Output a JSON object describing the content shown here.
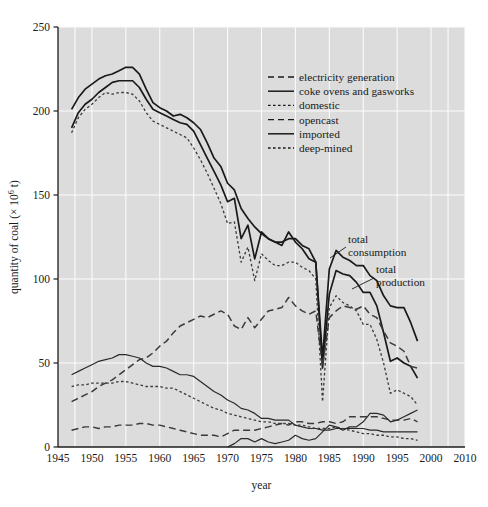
{
  "chart_data": {
    "type": "line",
    "title": "",
    "xlabel": "year",
    "ylabel": "quantity of coal (× 10⁶ t)",
    "xlim": [
      1945,
      2010
    ],
    "ylim": [
      0,
      250
    ],
    "xticks": [
      1945,
      1950,
      1955,
      1960,
      1965,
      1970,
      1975,
      1980,
      1985,
      1990,
      1995,
      2000,
      2010
    ],
    "xtick_labels": [
      "1945",
      "1950",
      "1955",
      "1960",
      "1965",
      "1970",
      "1975",
      "1980",
      "1985",
      "1990",
      "1995",
      "2000",
      "2010"
    ],
    "yticks": [
      0,
      50,
      100,
      150,
      200,
      250
    ],
    "ytick_labels": [
      "0",
      "50",
      "100",
      "150",
      "200",
      "250"
    ],
    "grid": "white gridlines on gray panel, both axes",
    "legend_position": "upper right inside panel",
    "series": [
      {
        "name": "total consumption",
        "style": "solid",
        "color": "#1a1a1a",
        "width": 1.7,
        "annotated": true,
        "x": [
          1947,
          1948,
          1949,
          1950,
          1951,
          1952,
          1953,
          1954,
          1955,
          1956,
          1957,
          1958,
          1959,
          1960,
          1961,
          1962,
          1963,
          1964,
          1965,
          1966,
          1967,
          1968,
          1969,
          1970,
          1971,
          1972,
          1973,
          1974,
          1975,
          1976,
          1977,
          1978,
          1979,
          1980,
          1981,
          1982,
          1983,
          1984,
          1985,
          1986,
          1987,
          1988,
          1989,
          1990,
          1991,
          1992,
          1993,
          1994,
          1995,
          1996,
          1997,
          1998
        ],
        "values": [
          201,
          208,
          213,
          216,
          219,
          221,
          222,
          224,
          226,
          226,
          222,
          213,
          205,
          202,
          200,
          197,
          198,
          196,
          193,
          189,
          181,
          172,
          167,
          157,
          153,
          142,
          136,
          131,
          127,
          124,
          122,
          120,
          128,
          122,
          118,
          112,
          110,
          53,
          106,
          117,
          113,
          111,
          108,
          108,
          102,
          99,
          90,
          84,
          83,
          83,
          74,
          63
        ]
      },
      {
        "name": "total production",
        "style": "solid",
        "color": "#1a1a1a",
        "width": 1.7,
        "annotated": true,
        "x": [
          1947,
          1948,
          1949,
          1950,
          1951,
          1952,
          1953,
          1954,
          1955,
          1956,
          1957,
          1958,
          1959,
          1960,
          1961,
          1962,
          1963,
          1964,
          1965,
          1966,
          1967,
          1968,
          1969,
          1970,
          1971,
          1972,
          1973,
          1974,
          1975,
          1976,
          1977,
          1978,
          1979,
          1980,
          1981,
          1982,
          1983,
          1984,
          1985,
          1986,
          1987,
          1988,
          1989,
          1990,
          1991,
          1992,
          1993,
          1994,
          1995,
          1996,
          1997,
          1998
        ],
        "values": [
          190,
          199,
          204,
          207,
          211,
          214,
          217,
          218,
          218,
          218,
          214,
          207,
          201,
          199,
          197,
          195,
          193,
          192,
          188,
          180,
          172,
          164,
          156,
          146,
          148,
          124,
          132,
          112,
          128,
          124,
          122,
          122,
          124,
          124,
          120,
          118,
          110,
          47,
          91,
          105,
          103,
          102,
          98,
          92,
          92,
          84,
          68,
          51,
          53,
          50,
          48,
          41
        ]
      },
      {
        "name": "deep-mined",
        "style": "dotted",
        "color": "#3a3a3a",
        "width": 1.3,
        "annotated": false,
        "x": [
          1947,
          1948,
          1949,
          1950,
          1951,
          1952,
          1953,
          1954,
          1955,
          1956,
          1957,
          1958,
          1959,
          1960,
          1961,
          1962,
          1963,
          1964,
          1965,
          1966,
          1967,
          1968,
          1969,
          1970,
          1971,
          1972,
          1973,
          1974,
          1975,
          1976,
          1977,
          1978,
          1979,
          1980,
          1981,
          1982,
          1983,
          1984,
          1985,
          1986,
          1987,
          1988,
          1989,
          1990,
          1991,
          1992,
          1993,
          1994,
          1995,
          1996,
          1997,
          1998
        ],
        "values": [
          187,
          196,
          201,
          204,
          208,
          211,
          210,
          211,
          211,
          210,
          206,
          199,
          194,
          192,
          190,
          188,
          186,
          184,
          178,
          171,
          163,
          154,
          145,
          133,
          134,
          110,
          119,
          99,
          115,
          111,
          108,
          108,
          110,
          110,
          107,
          105,
          100,
          27,
          83,
          90,
          86,
          84,
          81,
          73,
          73,
          64,
          50,
          32,
          34,
          32,
          30,
          25
        ]
      },
      {
        "name": "electricity generation",
        "style": "dashed",
        "color": "#3a3a3a",
        "width": 1.5,
        "annotated": false,
        "x": [
          1947,
          1948,
          1949,
          1950,
          1951,
          1952,
          1953,
          1954,
          1955,
          1956,
          1957,
          1958,
          1959,
          1960,
          1961,
          1962,
          1963,
          1964,
          1965,
          1966,
          1967,
          1968,
          1969,
          1970,
          1971,
          1972,
          1973,
          1974,
          1975,
          1976,
          1977,
          1978,
          1979,
          1980,
          1981,
          1982,
          1983,
          1984,
          1985,
          1986,
          1987,
          1988,
          1989,
          1990,
          1991,
          1992,
          1993,
          1994,
          1995,
          1996,
          1997,
          1998
        ],
        "values": [
          27,
          29,
          31,
          33,
          36,
          38,
          40,
          43,
          46,
          49,
          52,
          53,
          56,
          60,
          63,
          68,
          72,
          74,
          76,
          78,
          77,
          79,
          81,
          79,
          72,
          70,
          77,
          71,
          76,
          81,
          82,
          83,
          89,
          84,
          81,
          79,
          81,
          48,
          77,
          81,
          84,
          83,
          82,
          84,
          79,
          77,
          69,
          62,
          60,
          57,
          48,
          47
        ]
      },
      {
        "name": "coke ovens and gasworks",
        "style": "solid",
        "color": "#2a2a2a",
        "width": 1.2,
        "annotated": false,
        "x": [
          1947,
          1948,
          1949,
          1950,
          1951,
          1952,
          1953,
          1954,
          1955,
          1956,
          1957,
          1958,
          1959,
          1960,
          1961,
          1962,
          1963,
          1964,
          1965,
          1966,
          1967,
          1968,
          1969,
          1970,
          1971,
          1972,
          1973,
          1974,
          1975,
          1976,
          1977,
          1978,
          1979,
          1980,
          1981,
          1982,
          1983,
          1984,
          1985,
          1986,
          1987,
          1988,
          1989,
          1990,
          1991,
          1992,
          1993,
          1994,
          1995,
          1996,
          1997,
          1998
        ],
        "values": [
          43,
          45,
          47,
          49,
          51,
          52,
          53,
          55,
          55,
          54,
          53,
          50,
          48,
          48,
          47,
          45,
          43,
          43,
          42,
          39,
          36,
          33,
          31,
          28,
          26,
          23,
          22,
          20,
          17,
          17,
          16,
          16,
          16,
          13,
          12,
          11,
          11,
          10,
          10,
          11,
          11,
          11,
          11,
          11,
          10,
          10,
          9,
          9,
          9,
          9,
          9,
          9
        ]
      },
      {
        "name": "domestic",
        "style": "dotted",
        "color": "#3a3a3a",
        "width": 1.3,
        "annotated": false,
        "x": [
          1947,
          1948,
          1949,
          1950,
          1951,
          1952,
          1953,
          1954,
          1955,
          1956,
          1957,
          1958,
          1959,
          1960,
          1961,
          1962,
          1963,
          1964,
          1965,
          1966,
          1967,
          1968,
          1969,
          1970,
          1971,
          1972,
          1973,
          1974,
          1975,
          1976,
          1977,
          1978,
          1979,
          1980,
          1981,
          1982,
          1983,
          1984,
          1985,
          1986,
          1987,
          1988,
          1989,
          1990,
          1991,
          1992,
          1993,
          1994,
          1995,
          1996,
          1997,
          1998
        ],
        "values": [
          36,
          37,
          37,
          38,
          38,
          38,
          38,
          39,
          39,
          38,
          37,
          36,
          36,
          36,
          35,
          35,
          33,
          31,
          29,
          27,
          25,
          23,
          22,
          20,
          19,
          18,
          17,
          16,
          15,
          15,
          14,
          14,
          14,
          13,
          13,
          12,
          11,
          11,
          11,
          12,
          11,
          10,
          9,
          8,
          8,
          7,
          7,
          6,
          6,
          5,
          5,
          4
        ]
      },
      {
        "name": "opencast",
        "style": "dashed",
        "color": "#3a3a3a",
        "width": 1.4,
        "annotated": false,
        "x": [
          1947,
          1948,
          1949,
          1950,
          1951,
          1952,
          1953,
          1954,
          1955,
          1956,
          1957,
          1958,
          1959,
          1960,
          1961,
          1962,
          1963,
          1964,
          1965,
          1966,
          1967,
          1968,
          1969,
          1970,
          1971,
          1972,
          1973,
          1974,
          1975,
          1976,
          1977,
          1978,
          1979,
          1980,
          1981,
          1982,
          1983,
          1984,
          1985,
          1986,
          1987,
          1988,
          1989,
          1990,
          1991,
          1992,
          1993,
          1994,
          1995,
          1996,
          1997,
          1998
        ],
        "values": [
          10,
          11,
          12,
          12,
          11,
          12,
          12,
          13,
          13,
          13,
          14,
          14,
          13,
          13,
          12,
          11,
          10,
          9,
          8,
          7,
          7,
          7,
          6,
          8,
          10,
          10,
          10,
          10,
          11,
          12,
          13,
          14,
          13,
          15,
          15,
          14,
          14,
          15,
          15,
          14,
          15,
          18,
          18,
          18,
          18,
          18,
          17,
          16,
          16,
          16,
          17,
          15
        ]
      },
      {
        "name": "imported",
        "style": "solid",
        "color": "#2a2a2a",
        "width": 1.2,
        "annotated": false,
        "x": [
          1970,
          1971,
          1972,
          1973,
          1974,
          1975,
          1976,
          1977,
          1978,
          1979,
          1980,
          1981,
          1982,
          1983,
          1984,
          1985,
          1986,
          1987,
          1988,
          1989,
          1990,
          1991,
          1992,
          1993,
          1994,
          1995,
          1996,
          1997,
          1998
        ],
        "values": [
          0,
          2,
          5,
          5,
          3,
          5,
          3,
          2,
          3,
          4,
          7,
          5,
          4,
          5,
          9,
          13,
          12,
          10,
          12,
          12,
          15,
          20,
          20,
          19,
          15,
          16,
          18,
          20,
          22
        ]
      }
    ],
    "annotations": [
      {
        "text_line1": "total",
        "text_line2": "consumption",
        "label": "total consumption"
      },
      {
        "text_line1": "total",
        "text_line2": "production",
        "label": "total production"
      }
    ],
    "legend_entries": [
      {
        "label": "electricity generation",
        "style": "dashed"
      },
      {
        "label": "coke ovens and gasworks",
        "style": "solid"
      },
      {
        "label": "domestic",
        "style": "dotted"
      },
      {
        "label": "opencast",
        "style": "dashed"
      },
      {
        "label": "imported",
        "style": "solid"
      },
      {
        "label": "deep-mined",
        "style": "dotted"
      }
    ],
    "colors": {
      "panel": "#dcdcdc",
      "grid": "#fbfbfb",
      "axis": "#1c1c1c",
      "text": "#1a1a1a"
    }
  }
}
